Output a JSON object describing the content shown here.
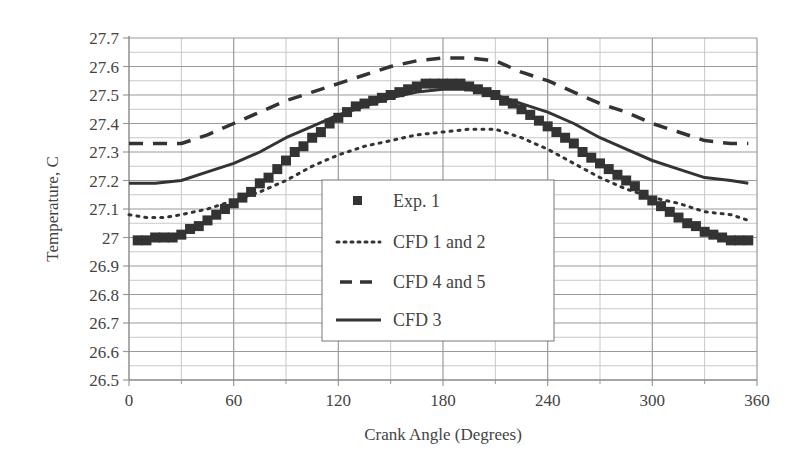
{
  "chart_data": {
    "type": "line",
    "title": "",
    "xlabel": "Crank Angle (Degrees)",
    "ylabel": "Temperature, C",
    "xlim": [
      0,
      360
    ],
    "ylim": [
      26.5,
      27.7
    ],
    "xticks": [
      0,
      60,
      120,
      180,
      240,
      300,
      360
    ],
    "xtick_labels": [
      "0",
      "60",
      "120",
      "180",
      "240",
      "300",
      "360"
    ],
    "yticks": [
      26.5,
      26.6,
      26.7,
      26.8,
      26.9,
      27.0,
      27.1,
      27.2,
      27.3,
      27.4,
      27.5,
      27.6,
      27.7
    ],
    "ytick_labels": [
      "26.5",
      "26.6",
      "26.7",
      "26.8",
      "26.9",
      "27",
      "27.1",
      "27.2",
      "27.3",
      "27.4",
      "27.5",
      "27.6",
      "27.7"
    ],
    "grid": {
      "major_x_step": 60,
      "minor_x_step": 30,
      "major_y_step": 0.1,
      "minor_y_step": 0.05
    },
    "legend": {
      "position": "center-bottom-inside"
    },
    "series": [
      {
        "name": "Exp. 1",
        "style": "square-markers",
        "x": [
          5,
          10,
          15,
          20,
          25,
          30,
          35,
          40,
          45,
          50,
          55,
          60,
          65,
          70,
          75,
          80,
          85,
          90,
          95,
          100,
          105,
          110,
          115,
          120,
          125,
          130,
          135,
          140,
          145,
          150,
          155,
          160,
          165,
          170,
          175,
          180,
          185,
          190,
          195,
          200,
          205,
          210,
          215,
          220,
          225,
          230,
          235,
          240,
          245,
          250,
          255,
          260,
          265,
          270,
          275,
          280,
          285,
          290,
          295,
          300,
          305,
          310,
          315,
          320,
          325,
          330,
          335,
          340,
          345,
          350,
          355
        ],
        "values": [
          26.99,
          26.99,
          27.0,
          27.0,
          27.0,
          27.01,
          27.03,
          27.04,
          27.06,
          27.08,
          27.1,
          27.12,
          27.14,
          27.16,
          27.19,
          27.21,
          27.24,
          27.27,
          27.3,
          27.32,
          27.35,
          27.37,
          27.4,
          27.42,
          27.44,
          27.46,
          27.47,
          27.48,
          27.49,
          27.5,
          27.51,
          27.52,
          27.53,
          27.54,
          27.54,
          27.54,
          27.54,
          27.54,
          27.53,
          27.52,
          27.51,
          27.5,
          27.48,
          27.47,
          27.45,
          27.43,
          27.41,
          27.39,
          27.37,
          27.35,
          27.33,
          27.3,
          27.28,
          27.26,
          27.24,
          27.22,
          27.2,
          27.18,
          27.15,
          27.13,
          27.11,
          27.09,
          27.07,
          27.05,
          27.04,
          27.02,
          27.01,
          27.0,
          26.99,
          26.99,
          26.99
        ]
      },
      {
        "name": "CFD 1 and 2",
        "style": "dotted",
        "x": [
          0,
          10,
          20,
          30,
          45,
          60,
          75,
          90,
          105,
          120,
          135,
          150,
          165,
          180,
          195,
          210,
          225,
          240,
          255,
          270,
          285,
          300,
          315,
          330,
          345,
          355
        ],
        "values": [
          27.08,
          27.07,
          27.07,
          27.08,
          27.1,
          27.13,
          27.16,
          27.2,
          27.25,
          27.29,
          27.32,
          27.34,
          27.36,
          27.37,
          27.38,
          27.38,
          27.35,
          27.31,
          27.26,
          27.21,
          27.17,
          27.14,
          27.12,
          27.09,
          27.08,
          27.06
        ]
      },
      {
        "name": "CFD 4 and 5",
        "style": "dashed",
        "x": [
          0,
          15,
          30,
          45,
          60,
          75,
          90,
          105,
          120,
          135,
          150,
          165,
          180,
          195,
          210,
          225,
          240,
          255,
          270,
          285,
          300,
          315,
          330,
          345,
          355
        ],
        "values": [
          27.33,
          27.33,
          27.33,
          27.36,
          27.4,
          27.44,
          27.48,
          27.51,
          27.54,
          27.57,
          27.6,
          27.62,
          27.63,
          27.63,
          27.62,
          27.58,
          27.55,
          27.51,
          27.47,
          27.44,
          27.4,
          27.37,
          27.34,
          27.33,
          27.33
        ]
      },
      {
        "name": "CFD 3",
        "style": "solid",
        "x": [
          0,
          15,
          30,
          45,
          60,
          75,
          90,
          105,
          120,
          135,
          150,
          165,
          180,
          195,
          210,
          225,
          240,
          255,
          270,
          285,
          300,
          315,
          330,
          345,
          355
        ],
        "values": [
          27.19,
          27.19,
          27.2,
          27.23,
          27.26,
          27.3,
          27.35,
          27.39,
          27.43,
          27.46,
          27.49,
          27.51,
          27.52,
          27.52,
          27.5,
          27.47,
          27.44,
          27.4,
          27.35,
          27.31,
          27.27,
          27.24,
          27.21,
          27.2,
          27.19
        ]
      }
    ]
  },
  "colors": {
    "series": "#333333",
    "grid_major": "#9a9a9a",
    "grid_minor": "#c8c8c8",
    "text": "#444444",
    "legend_border": "#777777"
  }
}
